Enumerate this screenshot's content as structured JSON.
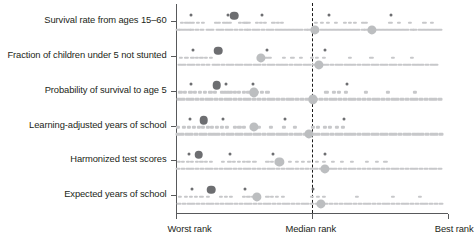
{
  "chart_data": {
    "type": "scatter",
    "title": "",
    "subtitle": "",
    "xlabel": "",
    "ylabel": "",
    "grid": false,
    "legend_position": "none",
    "xlim": [
      0,
      1
    ],
    "x_tick_labels": [
      "Worst rank",
      "Median rank",
      "Best rank"
    ],
    "x_tick_positions": [
      0.0,
      0.5,
      1.0
    ],
    "categories": [
      "Survival rate from ages 15–60",
      "Fraction of children under 5 not stunted",
      "Probability of survival to age 5",
      "Learning-adjusted years of school",
      "Harmonized test scores",
      "Expected years of school"
    ],
    "annotations": {
      "median_reference_line": 0.5,
      "median_line_style": "dashed"
    },
    "colors": {
      "dark_marker": "#6d6e71",
      "light_marker": "#bcbec0",
      "strip_marker": "#c7c8ca",
      "axis": "#58595b",
      "median_line": "#1a1a1a",
      "text": "#231f20"
    },
    "series": [
      {
        "name": "Survival rate from ages 15–60",
        "highlights": [
          {
            "x": 0.215,
            "size": "large",
            "shade": "dark"
          },
          {
            "x": 0.513,
            "size": "large",
            "shade": "light"
          },
          {
            "x": 0.722,
            "size": "large",
            "shade": "light"
          }
        ],
        "upper_points": [
          0.025,
          0.04,
          0.052,
          0.065,
          0.082,
          0.1,
          0.15,
          0.16,
          0.178,
          0.19,
          0.2,
          0.236,
          0.252,
          0.26,
          0.268,
          0.3,
          0.315,
          0.33,
          0.36,
          0.377,
          0.392,
          0.515,
          0.538,
          0.56,
          0.59,
          0.622,
          0.64,
          0.66,
          0.688,
          0.7,
          0.79,
          0.822,
          0.862,
          0.915,
          0.942
        ],
        "lower_points": [
          0.01,
          0.022,
          0.035,
          0.05,
          0.062,
          0.08,
          0.098,
          0.118,
          0.135,
          0.158,
          0.172,
          0.188,
          0.205,
          0.222,
          0.24,
          0.258,
          0.272,
          0.29,
          0.305,
          0.322,
          0.34,
          0.355,
          0.372,
          0.388,
          0.402,
          0.418,
          0.432,
          0.448,
          0.462,
          0.478,
          0.492,
          0.508,
          0.522,
          0.538,
          0.552,
          0.568,
          0.582,
          0.598,
          0.612,
          0.628,
          0.642,
          0.658,
          0.672,
          0.688,
          0.702,
          0.718,
          0.732,
          0.748,
          0.762,
          0.778,
          0.792,
          0.808,
          0.822,
          0.838,
          0.852,
          0.868,
          0.882,
          0.898,
          0.912,
          0.928,
          0.942,
          0.958,
          0.972
        ]
      },
      {
        "name": "Fraction of children under 5 not stunted",
        "highlights": [
          {
            "x": 0.157,
            "size": "large",
            "shade": "dark"
          },
          {
            "x": 0.315,
            "size": "large",
            "shade": "light"
          },
          {
            "x": 0.527,
            "size": "large",
            "shade": "light"
          }
        ],
        "upper_points": [
          0.02,
          0.04,
          0.062,
          0.078,
          0.095,
          0.112,
          0.13,
          0.31,
          0.32,
          0.332,
          0.345,
          0.4,
          0.43,
          0.462,
          0.5,
          0.52,
          0.545,
          0.64,
          0.72,
          0.8,
          0.87
        ],
        "lower_points": [
          0.015,
          0.03,
          0.048,
          0.065,
          0.082,
          0.1,
          0.12,
          0.14,
          0.158,
          0.175,
          0.192,
          0.208,
          0.225,
          0.242,
          0.258,
          0.275,
          0.292,
          0.308,
          0.325,
          0.342,
          0.358,
          0.375,
          0.392,
          0.408,
          0.425,
          0.442,
          0.458,
          0.475,
          0.492,
          0.508,
          0.525,
          0.542,
          0.558,
          0.575,
          0.592,
          0.608,
          0.625,
          0.642,
          0.658,
          0.675,
          0.692,
          0.708,
          0.725,
          0.742,
          0.758,
          0.775,
          0.792,
          0.808,
          0.825,
          0.842,
          0.858,
          0.875,
          0.892,
          0.908,
          0.925,
          0.942,
          0.958
        ]
      },
      {
        "name": "Probability of survival to age 5",
        "highlights": [
          {
            "x": 0.152,
            "size": "large",
            "shade": "dark"
          },
          {
            "x": 0.288,
            "size": "large",
            "shade": "light"
          },
          {
            "x": 0.505,
            "size": "large",
            "shade": "light"
          }
        ],
        "upper_points": [
          0.018,
          0.035,
          0.055,
          0.072,
          0.09,
          0.108,
          0.128,
          0.145,
          0.17,
          0.182,
          0.192,
          0.205,
          0.218,
          0.232,
          0.25,
          0.268,
          0.282,
          0.3,
          0.318,
          0.338,
          0.555,
          0.582,
          0.6,
          0.625,
          0.7,
          0.78,
          0.88
        ],
        "lower_points": [
          0.012,
          0.028,
          0.045,
          0.062,
          0.08,
          0.098,
          0.115,
          0.132,
          0.15,
          0.168,
          0.185,
          0.202,
          0.22,
          0.238,
          0.255,
          0.272,
          0.29,
          0.308,
          0.325,
          0.342,
          0.36,
          0.378,
          0.395,
          0.412,
          0.43,
          0.448,
          0.465,
          0.482,
          0.5,
          0.518,
          0.535,
          0.552,
          0.57,
          0.588,
          0.605,
          0.622,
          0.64,
          0.658,
          0.675,
          0.692,
          0.71,
          0.728,
          0.745,
          0.762,
          0.78,
          0.798,
          0.815,
          0.832,
          0.85,
          0.868,
          0.885,
          0.902,
          0.92,
          0.938,
          0.955,
          0.972
        ]
      },
      {
        "name": "Learning-adjusted years of school",
        "highlights": [
          {
            "x": 0.103,
            "size": "large",
            "shade": "dark"
          },
          {
            "x": 0.288,
            "size": "large",
            "shade": "light"
          },
          {
            "x": 0.49,
            "size": "large",
            "shade": "light"
          }
        ],
        "upper_points": [
          0.01,
          0.032,
          0.05,
          0.068,
          0.085,
          0.1,
          0.118,
          0.135,
          0.152,
          0.17,
          0.19,
          0.218,
          0.235,
          0.252,
          0.305,
          0.352,
          0.4,
          0.44,
          0.505,
          0.525,
          0.548,
          0.568,
          0.592,
          0.615
        ],
        "lower_points": [
          0.008,
          0.025,
          0.042,
          0.058,
          0.075,
          0.092,
          0.108,
          0.125,
          0.142,
          0.158,
          0.175,
          0.192,
          0.208,
          0.225,
          0.242,
          0.258,
          0.275,
          0.292,
          0.308,
          0.325,
          0.342,
          0.358,
          0.375,
          0.392,
          0.408,
          0.425,
          0.442,
          0.458,
          0.475,
          0.492,
          0.508,
          0.525,
          0.542,
          0.558,
          0.575,
          0.592,
          0.608,
          0.625,
          0.642,
          0.658,
          0.675,
          0.692,
          0.708,
          0.725,
          0.742,
          0.758,
          0.775,
          0.792,
          0.808,
          0.825,
          0.842,
          0.858,
          0.875,
          0.892,
          0.908,
          0.925,
          0.942,
          0.958,
          0.975
        ]
      },
      {
        "name": "Harmonized test scores",
        "highlights": [
          {
            "x": 0.085,
            "size": "large",
            "shade": "dark"
          },
          {
            "x": 0.382,
            "size": "large",
            "shade": "light"
          },
          {
            "x": 0.548,
            "size": "large",
            "shade": "light"
          }
        ],
        "upper_points": [
          0.012,
          0.028,
          0.045,
          0.06,
          0.078,
          0.095,
          0.112,
          0.13,
          0.175,
          0.198,
          0.215,
          0.232,
          0.25,
          0.268,
          0.29,
          0.338,
          0.355,
          0.372,
          0.42,
          0.445,
          0.468,
          0.49,
          0.52,
          0.545,
          0.578,
          0.612,
          0.648,
          0.705,
          0.74,
          0.772
        ],
        "lower_points": [
          0.01,
          0.028,
          0.045,
          0.062,
          0.08,
          0.098,
          0.115,
          0.132,
          0.15,
          0.168,
          0.185,
          0.202,
          0.22,
          0.238,
          0.255,
          0.272,
          0.29,
          0.308,
          0.325,
          0.342,
          0.36,
          0.378,
          0.395,
          0.412,
          0.43,
          0.448,
          0.465,
          0.482,
          0.5,
          0.518,
          0.535,
          0.552,
          0.57,
          0.588,
          0.605,
          0.622,
          0.64,
          0.658,
          0.675,
          0.692,
          0.71,
          0.728,
          0.745,
          0.762,
          0.78,
          0.798,
          0.815,
          0.832,
          0.85,
          0.868,
          0.885,
          0.902,
          0.92,
          0.938,
          0.955,
          0.972
        ]
      },
      {
        "name": "Expected years of school",
        "highlights": [
          {
            "x": 0.132,
            "size": "large",
            "shade": "dark"
          },
          {
            "x": 0.3,
            "size": "large",
            "shade": "light"
          },
          {
            "x": 0.535,
            "size": "large",
            "shade": "light"
          }
        ],
        "upper_points": [
          0.015,
          0.038,
          0.058,
          0.075,
          0.095,
          0.118,
          0.168,
          0.185,
          0.205,
          0.25,
          0.268,
          0.285,
          0.338,
          0.355,
          0.372,
          0.395,
          0.5,
          0.525,
          0.545,
          0.668,
          0.8,
          0.9
        ],
        "lower_points": [
          0.012,
          0.03,
          0.048,
          0.065,
          0.082,
          0.1,
          0.118,
          0.135,
          0.152,
          0.17,
          0.188,
          0.205,
          0.222,
          0.24,
          0.258,
          0.275,
          0.292,
          0.31,
          0.328,
          0.345,
          0.362,
          0.38,
          0.398,
          0.415,
          0.432,
          0.45,
          0.468,
          0.485,
          0.502,
          0.52,
          0.538,
          0.555,
          0.572,
          0.59,
          0.608,
          0.625,
          0.642,
          0.66,
          0.678,
          0.695,
          0.712,
          0.73,
          0.748,
          0.765,
          0.782,
          0.8,
          0.818,
          0.835,
          0.852,
          0.87,
          0.888,
          0.905,
          0.922,
          0.94,
          0.958,
          0.975
        ]
      }
    ]
  }
}
